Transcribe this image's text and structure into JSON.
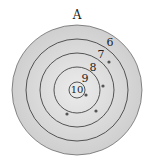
{
  "title": "A",
  "target": {
    "center": [
      77,
      90
    ],
    "rings": [
      {
        "score": "6",
        "radius": 65,
        "fill": "#d9d9d9",
        "label_pos": [
          110,
          46
        ]
      },
      {
        "score": "7",
        "radius": 51,
        "fill": "#dcdcdc",
        "label_pos": [
          101,
          58
        ]
      },
      {
        "score": "8",
        "radius": 37,
        "fill": "#dedede",
        "label_pos": [
          93,
          71
        ]
      },
      {
        "score": "9",
        "radius": 23,
        "fill": "#e0e0e0",
        "label_pos": [
          85,
          82
        ]
      },
      {
        "score": "10",
        "radius": 8,
        "fill": "#e3e3e3",
        "label_pos": [
          77,
          93
        ]
      }
    ],
    "stroke": "#444444",
    "hits": [
      [
        109,
        62
      ],
      [
        103,
        86
      ],
      [
        86,
        95
      ],
      [
        96,
        111
      ],
      [
        67,
        114
      ]
    ],
    "hit_color": "#555555"
  }
}
